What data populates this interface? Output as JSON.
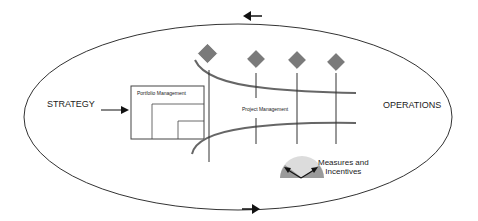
{
  "diagram": {
    "labels": {
      "strategy": "STRATEGY",
      "operations": "OPERATIONS",
      "portfolio_management": "Portfolio Management",
      "project_management": "Project Management",
      "measures_line1": "Measures and",
      "measures_line2": "Incentives"
    },
    "colors": {
      "ellipse_stroke": "#333333",
      "milestone_diamond": "#7a7a7a",
      "curve": "#666666",
      "gauge_light": "#dcdcdc",
      "gauge_dark": "#9a9a9a",
      "arrow": "#111111"
    },
    "milestones": [
      {
        "id": "m1",
        "x": 208,
        "y": 54
      },
      {
        "id": "m2",
        "x": 256,
        "y": 60
      },
      {
        "id": "m3",
        "x": 297,
        "y": 61
      },
      {
        "id": "m4",
        "x": 336,
        "y": 63
      }
    ],
    "flow_arrows": [
      {
        "id": "top-arrow",
        "direction": "left"
      },
      {
        "id": "bottom-arrow",
        "direction": "right"
      },
      {
        "id": "strategy-arrow",
        "direction": "right"
      }
    ]
  }
}
